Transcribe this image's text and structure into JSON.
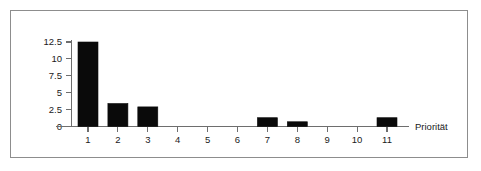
{
  "chart_data": {
    "type": "bar",
    "title": "",
    "subtitle": "",
    "xlabel": "Priorität",
    "ylabel": "",
    "categories": [
      "1",
      "2",
      "3",
      "4",
      "5",
      "6",
      "7",
      "8",
      "9",
      "10",
      "11"
    ],
    "values": [
      12.5,
      3.4,
      2.9,
      0,
      0,
      0,
      1.3,
      0.7,
      0,
      0,
      1.3
    ],
    "series": [
      {
        "name": "",
        "values": [
          12.5,
          3.4,
          2.9,
          0,
          0,
          0,
          1.3,
          0.7,
          0,
          0,
          1.3
        ]
      }
    ],
    "xlim": [
      0.4,
      11.9
    ],
    "ylim": [
      0,
      13.2
    ],
    "yticks": [
      0,
      2.5,
      5,
      7.5,
      10,
      12.5
    ],
    "ytick_labels": [
      "0",
      "2.5",
      "5",
      "7.5",
      "10",
      "12.5"
    ],
    "xtick_labels": [
      "1",
      "2",
      "3",
      "4",
      "5",
      "6",
      "7",
      "8",
      "9",
      "10",
      "11"
    ],
    "grid": false,
    "legend": false,
    "legend_position": "none",
    "bar_color": "#0a0a0a",
    "axis_color": "#6e6e6e",
    "frame_color": "#8d8d8d",
    "background_color": "#ffffff",
    "annotations": []
  },
  "figure": {
    "frame_label": "chart-frame"
  }
}
